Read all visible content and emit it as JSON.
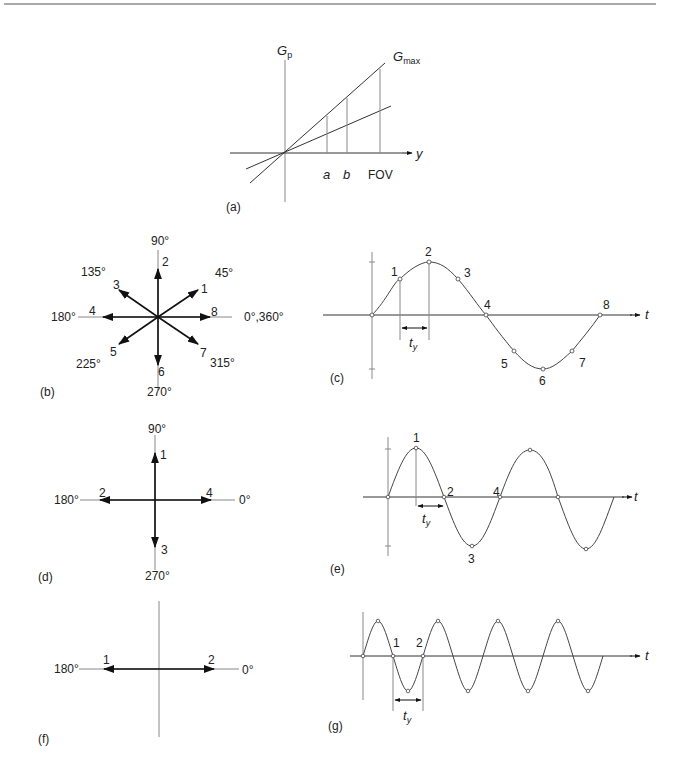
{
  "figure": {
    "panels": {
      "a": {
        "label": "(a)",
        "y_axis_label": "G",
        "y_axis_sub": "p",
        "x_axis_label": "y",
        "max_line_label": "G",
        "max_line_sub": "max",
        "ticks": [
          "a",
          "b",
          "FOV"
        ]
      },
      "b": {
        "label": "(b)",
        "angles": [
          "0°,360°",
          "45°",
          "90°",
          "135°",
          "180°",
          "225°",
          "270°",
          "315°"
        ],
        "vectors": [
          "1",
          "2",
          "3",
          "4",
          "5",
          "6",
          "7",
          "8"
        ]
      },
      "c": {
        "label": "(c)",
        "x_axis_label": "t",
        "interval_label": "t",
        "interval_sub": "y",
        "points": [
          "1",
          "2",
          "3",
          "4",
          "5",
          "6",
          "7",
          "8"
        ]
      },
      "d": {
        "label": "(d)",
        "angles": [
          "0°",
          "90°",
          "180°",
          "270°"
        ],
        "vectors": [
          "1",
          "2",
          "3",
          "4"
        ]
      },
      "e": {
        "label": "(e)",
        "x_axis_label": "t",
        "interval_label": "t",
        "interval_sub": "y",
        "points": [
          "1",
          "2",
          "3",
          "4"
        ]
      },
      "f": {
        "label": "(f)",
        "angles": [
          "0°",
          "180°"
        ],
        "vectors": [
          "1",
          "2"
        ]
      },
      "g": {
        "label": "(g)",
        "x_axis_label": "t",
        "interval_label": "t",
        "interval_sub": "y",
        "points": [
          "1",
          "2"
        ]
      }
    }
  }
}
